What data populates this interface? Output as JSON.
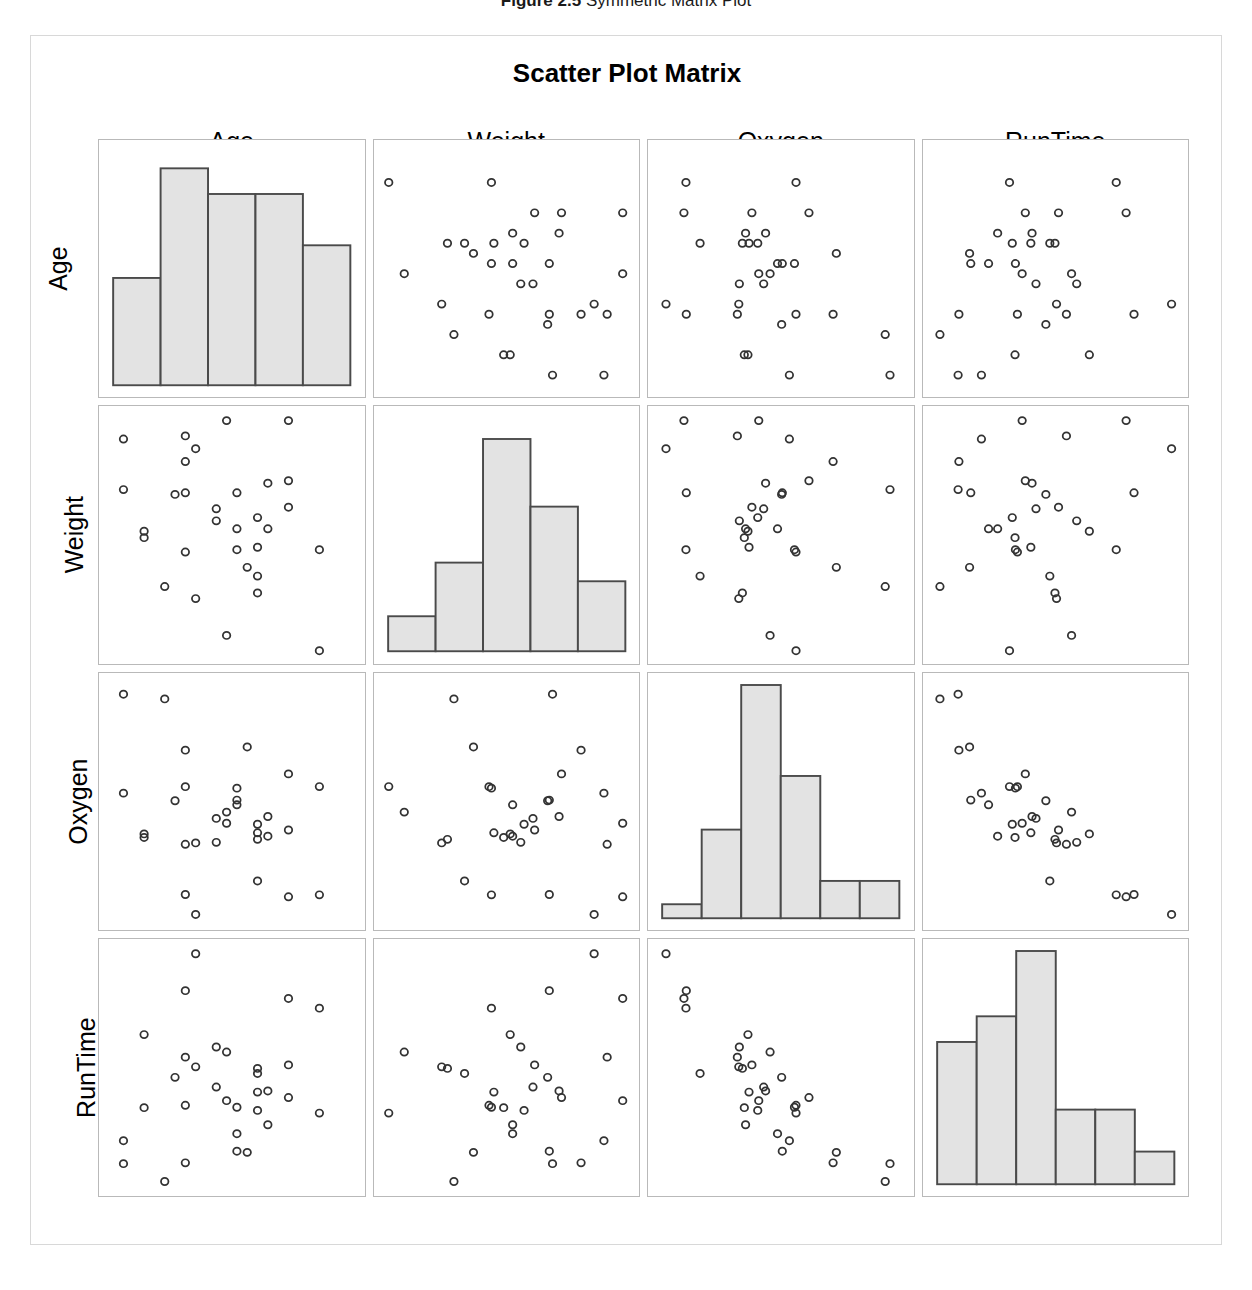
{
  "figure": {
    "number": "Figure 2.5",
    "caption": "Symmetric Matrix Plot"
  },
  "chart": {
    "title": "Scatter Plot Matrix",
    "variables": [
      "Age",
      "Weight",
      "Oxygen",
      "RunTime"
    ],
    "column_labels": [
      "Age",
      "Weight",
      "Oxygen",
      "RunTime"
    ],
    "row_labels": [
      "Age",
      "Weight",
      "Oxygen",
      "RunTime"
    ],
    "marker": "open-circle",
    "marker_color": "#333333",
    "histogram_fill": "#e3e3e3",
    "histogram_stroke": "#4a4a4a",
    "panel_border_color": "#b9b9b9",
    "frame_border_color": "#d8d8d8"
  },
  "chart_data": {
    "type": "scatter",
    "title": "Scatter Plot Matrix",
    "subtitle": "",
    "xlabel": "",
    "ylabel": "",
    "grid": false,
    "legend": "none",
    "layout": "4x4 scatter plot matrix; diagonal cells show histograms, off-diagonal cells show pairwise scatter plots",
    "variables": [
      "Age",
      "Weight",
      "Oxygen",
      "RunTime"
    ],
    "axis_ranges": {
      "Age": [
        37,
        60
      ],
      "Weight": [
        59,
        92
      ],
      "Oxygen": [
        37,
        61
      ],
      "RunTime": [
        8.1,
        14.1
      ]
    },
    "n_observations": 31,
    "observations": [
      {
        "Age": 44,
        "Weight": 89.47,
        "Oxygen": 44.609,
        "RunTime": 11.37
      },
      {
        "Age": 40,
        "Weight": 75.07,
        "Oxygen": 45.313,
        "RunTime": 10.07
      },
      {
        "Age": 44,
        "Weight": 85.84,
        "Oxygen": 54.297,
        "RunTime": 8.65
      },
      {
        "Age": 42,
        "Weight": 68.15,
        "Oxygen": 59.571,
        "RunTime": 8.17
      },
      {
        "Age": 38,
        "Weight": 89.02,
        "Oxygen": 49.874,
        "RunTime": 9.22
      },
      {
        "Age": 47,
        "Weight": 77.45,
        "Oxygen": 44.811,
        "RunTime": 11.63
      },
      {
        "Age": 40,
        "Weight": 75.98,
        "Oxygen": 45.681,
        "RunTime": 11.95
      },
      {
        "Age": 43,
        "Weight": 81.19,
        "Oxygen": 49.091,
        "RunTime": 10.85
      },
      {
        "Age": 44,
        "Weight": 81.42,
        "Oxygen": 39.442,
        "RunTime": 13.08
      },
      {
        "Age": 38,
        "Weight": 81.87,
        "Oxygen": 60.055,
        "RunTime": 8.63
      },
      {
        "Age": 44,
        "Weight": 73.03,
        "Oxygen": 50.541,
        "RunTime": 10.13
      },
      {
        "Age": 45,
        "Weight": 87.66,
        "Oxygen": 37.388,
        "RunTime": 14.03
      },
      {
        "Age": 45,
        "Weight": 66.45,
        "Oxygen": 44.754,
        "RunTime": 11.12
      },
      {
        "Age": 47,
        "Weight": 79.15,
        "Oxygen": 47.273,
        "RunTime": 10.6
      },
      {
        "Age": 54,
        "Weight": 83.12,
        "Oxygen": 51.855,
        "RunTime": 10.33
      },
      {
        "Age": 49,
        "Weight": 81.42,
        "Oxygen": 49.156,
        "RunTime": 8.95
      },
      {
        "Age": 51,
        "Weight": 69.63,
        "Oxygen": 40.836,
        "RunTime": 10.95
      },
      {
        "Age": 51,
        "Weight": 77.91,
        "Oxygen": 46.672,
        "RunTime": 10.0
      },
      {
        "Age": 48,
        "Weight": 91.63,
        "Oxygen": 46.774,
        "RunTime": 10.25
      },
      {
        "Age": 49,
        "Weight": 73.37,
        "Oxygen": 50.388,
        "RunTime": 10.08
      },
      {
        "Age": 57,
        "Weight": 73.37,
        "Oxygen": 39.407,
        "RunTime": 12.63
      },
      {
        "Age": 54,
        "Weight": 79.38,
        "Oxygen": 46.08,
        "RunTime": 11.17
      },
      {
        "Age": 52,
        "Weight": 76.32,
        "Oxygen": 45.441,
        "RunTime": 9.63
      },
      {
        "Age": 50,
        "Weight": 70.87,
        "Oxygen": 54.625,
        "RunTime": 8.92
      },
      {
        "Age": 51,
        "Weight": 67.25,
        "Oxygen": 45.118,
        "RunTime": 11.08
      },
      {
        "Age": 54,
        "Weight": 91.63,
        "Oxygen": 39.203,
        "RunTime": 12.88
      },
      {
        "Age": 51,
        "Weight": 73.71,
        "Oxygen": 45.79,
        "RunTime": 10.47
      },
      {
        "Age": 57,
        "Weight": 59.08,
        "Oxygen": 50.545,
        "RunTime": 9.93
      },
      {
        "Age": 49,
        "Weight": 76.32,
        "Oxygen": 48.673,
        "RunTime": 9.4
      },
      {
        "Age": 48,
        "Weight": 61.24,
        "Oxygen": 47.92,
        "RunTime": 11.5
      },
      {
        "Age": 52,
        "Weight": 82.78,
        "Oxygen": 47.467,
        "RunTime": 10.5
      }
    ],
    "histograms": [
      {
        "variable": "Age",
        "bin_count": 5,
        "bin_edges": [
          37,
          41.6,
          46.2,
          50.8,
          55.4,
          60
        ],
        "counts": [
          5,
          10,
          9,
          9,
          6.5
        ],
        "bar_heights_normalized": [
          0.46,
          0.93,
          0.82,
          0.82,
          0.6
        ]
      },
      {
        "variable": "Weight",
        "bin_count": 5,
        "bin_edges": [
          59,
          65.6,
          72.2,
          78.8,
          85.4,
          92
        ],
        "counts": [
          1.6,
          4.1,
          10,
          6.8,
          3.3
        ],
        "bar_heights_normalized": [
          0.15,
          0.38,
          0.91,
          0.62,
          0.3
        ]
      },
      {
        "variable": "Oxygen",
        "bin_count": 6,
        "bin_edges": [
          37,
          41,
          45,
          49,
          53,
          57,
          61
        ],
        "counts": [
          0.6,
          3.8,
          10,
          6.1,
          1.6,
          1.6
        ],
        "bar_heights_normalized": [
          0.06,
          0.38,
          1.0,
          0.61,
          0.16,
          0.16
        ]
      },
      {
        "variable": "RunTime",
        "bin_count": 6,
        "bin_edges": [
          8.1,
          9.1,
          10.1,
          11.1,
          12.1,
          13.1,
          14.1
        ],
        "counts": [
          6.1,
          7.2,
          10,
          3.2,
          3.2,
          1.4
        ],
        "bar_heights_normalized": [
          0.61,
          0.72,
          1.0,
          0.32,
          0.32,
          0.14
        ]
      }
    ]
  }
}
